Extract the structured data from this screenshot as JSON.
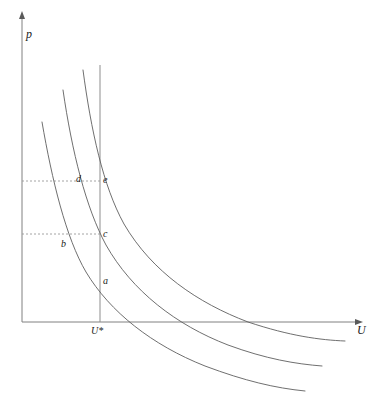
{
  "figure": {
    "background_color": "#ffffff",
    "width": 377,
    "height": 402
  },
  "axes": {
    "y_axis_label": "p",
    "x_axis_label": "U",
    "y_axis_color": "#808080",
    "x_axis_color": "#808080",
    "origin_px": {
      "x": 22,
      "y": 322
    },
    "y_top_px": 14,
    "x_right_px": 362
  },
  "vertical_line": {
    "tick_label": "U*",
    "x_px": 100,
    "top_px": 65,
    "bottom_px": 322,
    "color": "#8d8d8d"
  },
  "guides": [
    {
      "name": "upper-dotted-guide",
      "y_px": 181,
      "x_start_px": 22,
      "x_end_px": 100,
      "color": "#9a9a9a"
    },
    {
      "name": "lower-dotted-guide",
      "y_px": 234,
      "x_start_px": 22,
      "x_end_px": 100,
      "color": "#9a9a9a"
    }
  ],
  "point_labels": [
    {
      "id": "a",
      "text": "a",
      "x_px": 103,
      "y_px": 276
    },
    {
      "id": "b",
      "text": "b",
      "x_px": 61,
      "y_px": 239
    },
    {
      "id": "c",
      "text": "c",
      "x_px": 103,
      "y_px": 229
    },
    {
      "id": "d",
      "text": "d",
      "x_px": 76,
      "y_px": 174
    },
    {
      "id": "e",
      "text": "e",
      "x_px": 103,
      "y_px": 175
    }
  ],
  "chart_data": {
    "type": "line",
    "xlabel": "U",
    "ylabel": "p",
    "grid": false,
    "legend": false,
    "xlim": [
      22,
      362
    ],
    "ylim": [
      322,
      14
    ],
    "annotations": [
      {
        "label": "U*",
        "type": "x-tick",
        "x_px": 100
      },
      {
        "label": "a",
        "type": "point",
        "x_px": 100,
        "y_px": 281
      },
      {
        "label": "b",
        "type": "point",
        "x_px": 57,
        "y_px": 234
      },
      {
        "label": "c",
        "type": "point",
        "x_px": 100,
        "y_px": 234
      },
      {
        "label": "d",
        "type": "point",
        "x_px": 72,
        "y_px": 181
      },
      {
        "label": "e",
        "type": "point",
        "x_px": 100,
        "y_px": 181
      }
    ],
    "series": [
      {
        "name": "indifference-curve-low",
        "color": "#5f5f5f",
        "path": "M 42,122 C 52,180 66,238 86,272 C 110,312 152,345 205,366 C 245,381 275,388 305,391"
      },
      {
        "name": "indifference-curve-mid",
        "color": "#5f5f5f",
        "path": "M 63,90 C 72,152 86,208 106,245 C 132,291 176,325 228,345 C 266,359 296,364 322,366"
      },
      {
        "name": "indifference-curve-high",
        "color": "#5f5f5f",
        "path": "M 83,70 C 91,130 103,186 124,224 C 152,272 198,303 248,322 C 290,336 320,340 345,341"
      }
    ]
  }
}
